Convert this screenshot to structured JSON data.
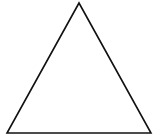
{
  "diagram": {
    "shape": "triangle",
    "kind": "equilateral-outline",
    "stroke_color": "#111111",
    "fill_color": "#ffffff",
    "background_color": "#ffffff"
  }
}
